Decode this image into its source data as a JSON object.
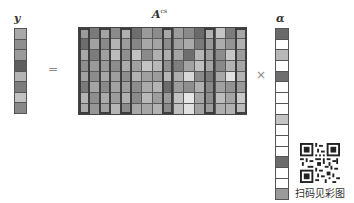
{
  "labels": {
    "y": "y",
    "A": "A",
    "A_sup": "cs",
    "alpha": "α",
    "equals": "=",
    "times": "×"
  },
  "y_vector": [
    "#a8a8a8",
    "#8e8e8e",
    "#9a9a9a",
    "#5e5e5e",
    "#b4b4b4",
    "#7c7c7c",
    "#c2c2c2",
    "#888888"
  ],
  "matrix": {
    "rows": 8,
    "cols": 16,
    "highlighted_columns": [
      0,
      2,
      4,
      8,
      12,
      15
    ],
    "cells": [
      [
        "#9c9c9c",
        "#7a7a7a",
        "#a4a4a4",
        "#8a8a8a",
        "#b0b0b0",
        "#6e6e6e",
        "#9a9a9a",
        "#8c8c8c",
        "#a8a8a8",
        "#9c9c9c",
        "#8a8a8a",
        "#6a6a6a",
        "#b2b2b2",
        "#c4c4c4",
        "#7c7c7c",
        "#a6a6a6"
      ],
      [
        "#6c6c6c",
        "#a2a2a2",
        "#8a8a8a",
        "#b4b4b4",
        "#9c9c9c",
        "#868686",
        "#a8a8a8",
        "#a4a4a4",
        "#8c8c8c",
        "#9e9e9e",
        "#aaaaaa",
        "#7a7a7a",
        "#989898",
        "#acacac",
        "#949494",
        "#b0b0b0"
      ],
      [
        "#a6a6a6",
        "#7c7c7c",
        "#a0a0a0",
        "#bcbcbc",
        "#909090",
        "#c2c2c2",
        "#8a8a8a",
        "#b0b0b0",
        "#aeaeae",
        "#a4a4a4",
        "#6e6e6e",
        "#b6b6b6",
        "#9e9e9e",
        "#8c8c8c",
        "#c6c6c6",
        "#9c9c9c"
      ],
      [
        "#8e8e8e",
        "#9a9a9a",
        "#989898",
        "#8c8c8c",
        "#acacac",
        "#a0a0a0",
        "#c4c4c4",
        "#b8b8b8",
        "#909090",
        "#7e7e7e",
        "#a2a2a2",
        "#c0c0c0",
        "#a4a4a4",
        "#888888",
        "#b2b2b2",
        "#a6a6a6"
      ],
      [
        "#a2a2a2",
        "#8c8c8c",
        "#a6a6a6",
        "#9e9e9e",
        "#8e8e8e",
        "#b2b2b2",
        "#a0a0a0",
        "#9c9c9c",
        "#b6b6b6",
        "#aeaeae",
        "#d8d8d8",
        "#8a8a8a",
        "#7a7a7a",
        "#a8a8a8",
        "#e2e2e2",
        "#b4b4b4"
      ],
      [
        "#7a7a7a",
        "#a4a4a4",
        "#8a8a8a",
        "#a2a2a2",
        "#9e9e9e",
        "#8c8c8c",
        "#aaaaaa",
        "#b4b4b4",
        "#6c6c6c",
        "#9c9c9c",
        "#8e8e8e",
        "#b0b0b0",
        "#888888",
        "#a0a0a0",
        "#929292",
        "#9a9a9a"
      ],
      [
        "#b4b4b4",
        "#8e8e8e",
        "#aaaaaa",
        "#9c9c9c",
        "#b0b0b0",
        "#8a8a8a",
        "#b8b8b8",
        "#9e9e9e",
        "#9a9a9a",
        "#c2c2c2",
        "#e6e6e6",
        "#a6a6a6",
        "#8e8e8e",
        "#bcbcbc",
        "#a4a4a4",
        "#c8c8c8"
      ],
      [
        "#aaaaaa",
        "#969696",
        "#a0a0a0",
        "#b6b6b6",
        "#8c8c8c",
        "#a8a8a8",
        "#a6a6a6",
        "#b2b2b2",
        "#8a8a8a",
        "#bebebe",
        "#e0e0e0",
        "#a2a2a2",
        "#9c9c9c",
        "#aeaeae",
        "#b0b0b0",
        "#bababa"
      ]
    ]
  },
  "alpha_vector": [
    "#6a6a6a",
    "#ffffff",
    "#b8b8b8",
    "#ffffff",
    "#6e6e6e",
    "#ffffff",
    "#ffffff",
    "#ffffff",
    "#c4c4c4",
    "#ffffff",
    "#ffffff",
    "#ffffff",
    "#6c6c6c",
    "#ffffff",
    "#ffffff",
    "#9a9a9a"
  ],
  "qr_caption": "扫码见彩图"
}
